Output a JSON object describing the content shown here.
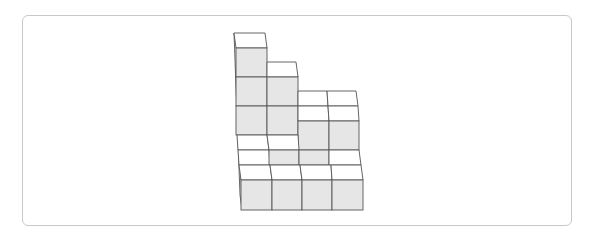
{
  "figure": {
    "type": "isometric-cube-stack",
    "cube_size_px": 31,
    "colors": {
      "front_face": "#e6e6e6",
      "top_face": "#ffffff",
      "edge": "#555555",
      "frame_border": "#c8c8c8"
    },
    "back_row_heights": [
      4,
      3,
      2,
      2
    ],
    "front_row_heights": [
      1,
      1,
      1,
      1
    ],
    "middle_row_heights": [
      1,
      1,
      1,
      1
    ]
  }
}
